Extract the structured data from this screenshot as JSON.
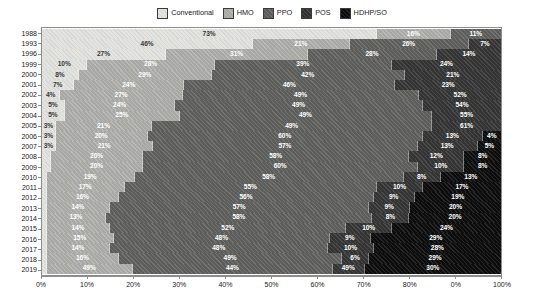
{
  "chart_data": {
    "type": "bar",
    "orientation": "horizontal",
    "stacked": true,
    "title": "",
    "subtitle": "",
    "xlabel": "",
    "ylabel": "",
    "xlim": [
      0,
      100
    ],
    "grid": false,
    "legend_position": "top-center",
    "value_suffix": "%",
    "series": [
      {
        "name": "Conventional",
        "color": "#e3e3e0",
        "values": [
          73,
          46,
          27,
          10,
          8,
          7,
          4,
          5,
          5,
          3,
          3,
          3,
          2,
          2,
          1,
          1,
          1,
          1,
          1,
          1,
          1,
          1,
          1,
          1
        ]
      },
      {
        "name": "HMO",
        "color": "#a8a8a5",
        "values": [
          16,
          21,
          31,
          28,
          29,
          24,
          27,
          24,
          25,
          21,
          20,
          21,
          20,
          20,
          19,
          17,
          16,
          14,
          13,
          14,
          15,
          14,
          16,
          19
        ]
      },
      {
        "name": "PPO",
        "color": "#5d5d5c",
        "values": [
          11,
          26,
          28,
          39,
          42,
          46,
          52,
          54,
          55,
          61,
          60,
          57,
          58,
          60,
          58,
          55,
          56,
          57,
          58,
          52,
          48,
          48,
          49,
          44
        ]
      },
      {
        "name": "POS",
        "color": "#343434",
        "values": [
          0,
          7,
          14,
          24,
          21,
          23,
          18,
          17,
          15,
          15,
          13,
          13,
          12,
          10,
          8,
          10,
          9,
          9,
          8,
          10,
          9,
          10,
          6,
          7
        ]
      },
      {
        "name": "HDHP/SO",
        "color": "#0d0d0d",
        "values": [
          0,
          0,
          0,
          0,
          0,
          0,
          0,
          0,
          0,
          0,
          4,
          5,
          8,
          8,
          13,
          17,
          19,
          20,
          20,
          24,
          29,
          28,
          29,
          30
        ]
      }
    ],
    "categories": [
      "1988",
      "1993",
      "1996",
      "1999",
      "2000",
      "2001",
      "2002",
      "2003",
      "2004",
      "2005",
      "2006",
      "2007",
      "2008",
      "2009",
      "2010",
      "2011",
      "2012",
      "2013",
      "2014",
      "2015",
      "2016",
      "2017",
      "2018",
      "2019"
    ],
    "bar_labels": [
      [
        "73%",
        "16%",
        "11%",
        "",
        ""
      ],
      [
        "46%",
        "21%",
        "26%",
        "7%",
        ""
      ],
      [
        "27%",
        "31%",
        "28%",
        "14%",
        ""
      ],
      [
        "10%",
        "28%",
        "39%",
        "24%",
        ""
      ],
      [
        "8%",
        "29%",
        "42%",
        "21%",
        ""
      ],
      [
        "7%",
        "24%",
        "46%",
        "23%",
        ""
      ],
      [
        "4%",
        "27%",
        "49%",
        "52%",
        "18%"
      ],
      [
        "5%",
        "24%",
        "49%",
        "54%",
        "17%"
      ],
      [
        "5%",
        "25%",
        "49%",
        "55%",
        "15%"
      ],
      [
        "3%",
        "21%",
        "49%",
        "61%",
        "15%"
      ],
      [
        "3%",
        "20%",
        "60%",
        "13%",
        "4%"
      ],
      [
        "3%",
        "21%",
        "57%",
        "13%",
        "5%"
      ],
      [
        "",
        "20%",
        "58%",
        "12%",
        "8%"
      ],
      [
        "",
        "20%",
        "60%",
        "10%",
        "8%"
      ],
      [
        "",
        "19%",
        "58%",
        "8%",
        "13%"
      ],
      [
        "",
        "17%",
        "55%",
        "10%",
        "17%"
      ],
      [
        "",
        "16%",
        "56%",
        "9%",
        "19%"
      ],
      [
        "",
        "14%",
        "57%",
        "9%",
        "20%"
      ],
      [
        "",
        "13%",
        "58%",
        "8%",
        "20%"
      ],
      [
        "",
        "14%",
        "52%",
        "10%",
        "24%"
      ],
      [
        "",
        "15%",
        "48%",
        "9%",
        "29%"
      ],
      [
        "",
        "14%",
        "48%",
        "10%",
        "28%"
      ],
      [
        "",
        "16%",
        "49%",
        "6%",
        "29%"
      ],
      [
        "",
        "49%",
        "44%",
        "49%",
        "30%"
      ]
    ],
    "xticks": [
      {
        "value": 0,
        "label": "0%"
      },
      {
        "value": 10,
        "label": "10%"
      },
      {
        "value": 20,
        "label": "20%"
      },
      {
        "value": 30,
        "label": "30%"
      },
      {
        "value": 40,
        "label": "40%"
      },
      {
        "value": 50,
        "label": "50%"
      },
      {
        "value": 60,
        "label": "60%"
      },
      {
        "value": 70,
        "label": "70%"
      },
      {
        "value": 80,
        "label": "80%"
      },
      {
        "value": 90,
        "label": "0%"
      },
      {
        "value": 100,
        "label": "100%"
      }
    ]
  }
}
